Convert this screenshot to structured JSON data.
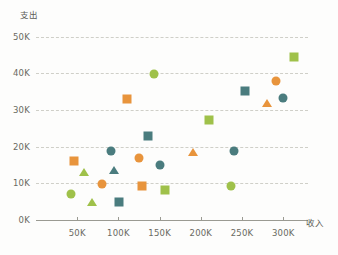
{
  "chart_data": {
    "type": "scatter",
    "title": "",
    "xlabel": "收入",
    "ylabel": "支出",
    "xlim": [
      0,
      330000
    ],
    "ylim": [
      0,
      52000
    ],
    "grid": true,
    "legend": "none",
    "x_tick_labels": [
      "50K",
      "100K",
      "150K",
      "200K",
      "250K",
      "300K"
    ],
    "x_tick_values": [
      50000,
      100000,
      150000,
      200000,
      250000,
      300000
    ],
    "y_tick_labels": [
      "0K",
      "10K",
      "20K",
      "30K",
      "40K",
      "50K"
    ],
    "y_tick_values": [
      0,
      10000,
      20000,
      30000,
      40000,
      50000
    ],
    "series": [
      {
        "name": "teal-circle",
        "color": "#4a7c7e",
        "marker": "circle",
        "points": [
          {
            "x": 91000,
            "y": 18800
          },
          {
            "x": 150000,
            "y": 15000
          },
          {
            "x": 240000,
            "y": 18800
          },
          {
            "x": 300000,
            "y": 33200
          }
        ]
      },
      {
        "name": "teal-square",
        "color": "#4a7c7e",
        "marker": "square",
        "points": [
          {
            "x": 136000,
            "y": 23000
          },
          {
            "x": 254000,
            "y": 35200
          },
          {
            "x": 101000,
            "y": 4800
          }
        ]
      },
      {
        "name": "teal-triangle",
        "color": "#4a7c7e",
        "marker": "triangle",
        "points": [
          {
            "x": 95000,
            "y": 13500
          }
        ]
      },
      {
        "name": "orange-circle",
        "color": "#e8943c",
        "marker": "circle",
        "points": [
          {
            "x": 80000,
            "y": 9800
          },
          {
            "x": 125000,
            "y": 17000
          },
          {
            "x": 291000,
            "y": 37800
          }
        ]
      },
      {
        "name": "orange-square",
        "color": "#e8943c",
        "marker": "square",
        "points": [
          {
            "x": 46000,
            "y": 16000
          },
          {
            "x": 111000,
            "y": 33000
          },
          {
            "x": 128000,
            "y": 9200
          }
        ]
      },
      {
        "name": "orange-triangle",
        "color": "#e8943c",
        "marker": "triangle",
        "points": [
          {
            "x": 190000,
            "y": 18500
          },
          {
            "x": 280000,
            "y": 31800
          }
        ]
      },
      {
        "name": "green-circle",
        "color": "#9fc14a",
        "marker": "circle",
        "points": [
          {
            "x": 42000,
            "y": 7000
          },
          {
            "x": 143000,
            "y": 39800
          },
          {
            "x": 236000,
            "y": 9200
          }
        ]
      },
      {
        "name": "green-square",
        "color": "#9fc14a",
        "marker": "square",
        "points": [
          {
            "x": 156000,
            "y": 8200
          },
          {
            "x": 210000,
            "y": 27200
          },
          {
            "x": 313000,
            "y": 44500
          }
        ]
      },
      {
        "name": "green-triangle",
        "color": "#9fc14a",
        "marker": "triangle",
        "points": [
          {
            "x": 58000,
            "y": 13000
          },
          {
            "x": 68000,
            "y": 4800
          }
        ]
      }
    ]
  }
}
